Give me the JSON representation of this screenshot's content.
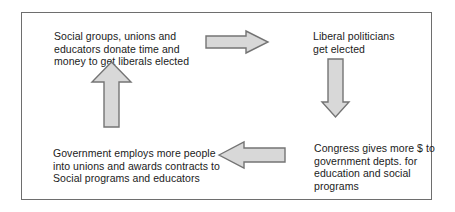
{
  "diagram": {
    "type": "cycle-flow-diagram",
    "frame": {
      "border_color": "#6e6e6e",
      "background": "#ffffff"
    },
    "arrow_style": {
      "fill": "#d8d8d8",
      "stroke": "#747474"
    },
    "nodes": [
      {
        "id": "top-left",
        "text": "Social groups, unions and\neducators donate time and\nmoney to get liberals elected"
      },
      {
        "id": "top-right",
        "text": "Liberal politicians\nget elected"
      },
      {
        "id": "bottom-right",
        "text": "Congress gives more $ to\ngovernment depts. for\neducation and social\nprograms"
      },
      {
        "id": "bottom-left",
        "text": "Government employs more people\ninto unions and awards contracts to\nSocial programs and educators"
      }
    ],
    "arrows": [
      {
        "id": "right",
        "icon": "arrow-right-icon",
        "from": "top-left",
        "to": "top-right"
      },
      {
        "id": "down",
        "icon": "arrow-down-icon",
        "from": "top-right",
        "to": "bottom-right"
      },
      {
        "id": "left",
        "icon": "arrow-left-icon",
        "from": "bottom-right",
        "to": "bottom-left"
      },
      {
        "id": "up",
        "icon": "arrow-up-icon",
        "from": "bottom-left",
        "to": "top-left"
      }
    ]
  }
}
